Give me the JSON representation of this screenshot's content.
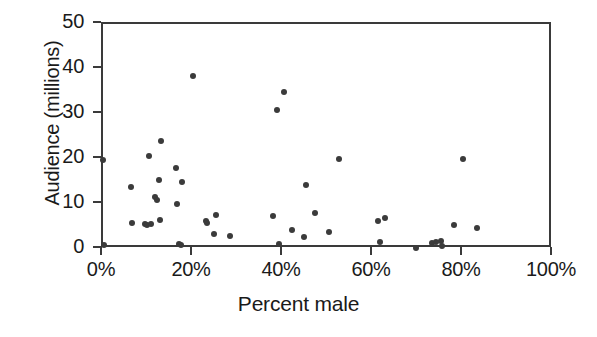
{
  "chart_data": {
    "type": "scatter",
    "title": "",
    "xlabel": "Percent male",
    "ylabel": "Audience (millions)",
    "xlim": [
      0,
      100
    ],
    "ylim": [
      0,
      50
    ],
    "grid": false,
    "legend": null,
    "x_tick_labels": [
      "0%",
      "20%",
      "40%",
      "60%",
      "80%",
      "100%"
    ],
    "x_tick_values": [
      0,
      20,
      40,
      60,
      80,
      100
    ],
    "y_tick_labels": [
      "0",
      "10",
      "20",
      "30",
      "40",
      "50"
    ],
    "y_tick_values": [
      0,
      10,
      20,
      30,
      40,
      50
    ],
    "marker_color": "#3b3b3b",
    "axis_color": "#3a3a3a",
    "points": [
      {
        "x": 0.0,
        "y": 19.8
      },
      {
        "x": 0.2,
        "y": 1.0
      },
      {
        "x": 6.3,
        "y": 13.7
      },
      {
        "x": 6.5,
        "y": 5.7
      },
      {
        "x": 9.3,
        "y": 5.6
      },
      {
        "x": 9.8,
        "y": 5.4
      },
      {
        "x": 10.2,
        "y": 20.6
      },
      {
        "x": 10.6,
        "y": 5.6
      },
      {
        "x": 11.6,
        "y": 11.6
      },
      {
        "x": 11.9,
        "y": 11.0
      },
      {
        "x": 12.4,
        "y": 15.3
      },
      {
        "x": 12.6,
        "y": 6.5
      },
      {
        "x": 12.8,
        "y": 23.9
      },
      {
        "x": 16.2,
        "y": 17.9
      },
      {
        "x": 16.4,
        "y": 10.1
      },
      {
        "x": 16.8,
        "y": 1.1
      },
      {
        "x": 17.3,
        "y": 0.9
      },
      {
        "x": 17.6,
        "y": 14.9
      },
      {
        "x": 19.9,
        "y": 38.4
      },
      {
        "x": 22.8,
        "y": 6.2
      },
      {
        "x": 23.2,
        "y": 5.7
      },
      {
        "x": 24.6,
        "y": 3.3
      },
      {
        "x": 25.2,
        "y": 7.6
      },
      {
        "x": 28.3,
        "y": 2.8
      },
      {
        "x": 37.8,
        "y": 7.4
      },
      {
        "x": 38.7,
        "y": 30.9
      },
      {
        "x": 39.1,
        "y": 1.2
      },
      {
        "x": 40.2,
        "y": 35.0
      },
      {
        "x": 41.9,
        "y": 4.2
      },
      {
        "x": 44.6,
        "y": 2.7
      },
      {
        "x": 45.1,
        "y": 14.3
      },
      {
        "x": 47.1,
        "y": 8.1
      },
      {
        "x": 50.2,
        "y": 3.8
      },
      {
        "x": 52.4,
        "y": 19.9
      },
      {
        "x": 61.2,
        "y": 6.3
      },
      {
        "x": 61.5,
        "y": 1.6
      },
      {
        "x": 62.7,
        "y": 6.8
      },
      {
        "x": 69.6,
        "y": 0.3
      },
      {
        "x": 73.2,
        "y": 1.3
      },
      {
        "x": 73.9,
        "y": 1.5
      },
      {
        "x": 75.1,
        "y": 1.8
      },
      {
        "x": 75.4,
        "y": 0.6
      },
      {
        "x": 78.0,
        "y": 5.3
      },
      {
        "x": 80.1,
        "y": 20.0
      },
      {
        "x": 83.2,
        "y": 4.6
      }
    ]
  }
}
